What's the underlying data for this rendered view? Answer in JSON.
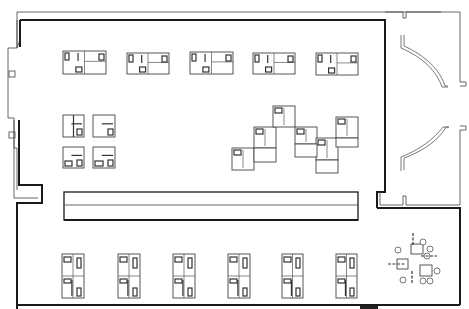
{
  "diagram": {
    "type": "architectural-floor-plan",
    "colors": {
      "background": "#ffffff",
      "line": "#2a2a2a",
      "line_light": "#555555"
    },
    "hall": {
      "outer_wall": "M17,12 L441,12 M17,12 L17,48 L8,48 L8,118 L14,118 L14,148 L17,148 L17,190",
      "inner_wall": "M20,20 L157,20 L157,20 L385,20 L385,195 L377,195",
      "corridor_left": "M17,190 L17,210 L42,210 L42,190 M20,190 L20,205 L42,205",
      "corridor_beam": {
        "x": 64,
        "y": 192,
        "w": 294,
        "h": 28
      },
      "corridor_divider_y": 205,
      "lower_wall": "M16,218 L16,309 M16,218 L42,218 L42,210",
      "right_lower_wall": "M377,195 L377,218 L460,218 L460,309",
      "bottom_line": "M16,307 L460,307"
    },
    "entry": {
      "outer_wall": "M385,12 L403,12 L403,18 L406,18 L406,12 L460,12 L460,82 L464,82 L464,85 L460,85",
      "outer_wall_lower": "M460,126 L464,126 L464,129 L460,129 L460,205 L403,205 L403,197 L406,197 L406,205",
      "doors": [
        {
          "name": "upper-curved-door",
          "path": "M404,35 L404,46 C426,56 440,70 445,86 L448,86"
        },
        {
          "name": "lower-curved-door",
          "path": "M404,170 L404,158 C426,150 440,138 446,127 L449,127"
        }
      ]
    },
    "top_row_units": [
      {
        "x": 63,
        "y": 51,
        "w": 43,
        "h": 23
      },
      {
        "x": 127,
        "y": 53,
        "w": 42,
        "h": 21
      },
      {
        "x": 190,
        "y": 52,
        "w": 43,
        "h": 22
      },
      {
        "x": 253,
        "y": 53,
        "w": 42,
        "h": 21
      },
      {
        "x": 316,
        "y": 53,
        "w": 42,
        "h": 22
      }
    ],
    "middle_left_units": [
      {
        "x": 63,
        "y": 115,
        "w": 21,
        "h": 22
      },
      {
        "x": 93,
        "y": 115,
        "w": 22,
        "h": 22
      },
      {
        "x": 63,
        "y": 147,
        "w": 21,
        "h": 21
      },
      {
        "x": 93,
        "y": 147,
        "w": 22,
        "h": 21
      }
    ],
    "stepped_cluster": [
      {
        "x": 232,
        "y": 148,
        "w": 22,
        "h": 22
      },
      {
        "x": 254,
        "y": 127,
        "w": 22,
        "h": 21
      },
      {
        "x": 273,
        "y": 106,
        "w": 22,
        "h": 21
      },
      {
        "x": 295,
        "y": 127,
        "w": 22,
        "h": 17
      },
      {
        "x": 316,
        "y": 138,
        "w": 22,
        "h": 22
      },
      {
        "x": 336,
        "y": 117,
        "w": 22,
        "h": 21
      }
    ],
    "bottom_row_units": [
      {
        "x": 62,
        "y": 254,
        "w": 22,
        "h": 44
      },
      {
        "x": 118,
        "y": 254,
        "w": 22,
        "h": 44
      },
      {
        "x": 173,
        "y": 254,
        "w": 22,
        "h": 44
      },
      {
        "x": 228,
        "y": 254,
        "w": 22,
        "h": 44
      },
      {
        "x": 282,
        "y": 254,
        "w": 21,
        "h": 44
      },
      {
        "x": 336,
        "y": 254,
        "w": 21,
        "h": 44
      }
    ],
    "furniture_group": {
      "tables": [
        {
          "x": 411,
          "y": 244,
          "w": 12,
          "h": 10
        },
        {
          "x": 397,
          "y": 259,
          "w": 11,
          "h": 10
        },
        {
          "x": 420,
          "y": 265,
          "w": 12,
          "h": 11
        }
      ],
      "chairs": [
        {
          "cx": 423,
          "cy": 242,
          "r": 3
        },
        {
          "cx": 430,
          "cy": 249,
          "r": 3
        },
        {
          "cx": 427,
          "cy": 256,
          "r": 3
        },
        {
          "cx": 398,
          "cy": 250,
          "r": 3
        },
        {
          "cx": 437,
          "cy": 271,
          "r": 3
        },
        {
          "cx": 403,
          "cy": 280,
          "r": 3
        },
        {
          "cx": 423,
          "cy": 281,
          "r": 3
        },
        {
          "cx": 430,
          "cy": 281,
          "r": 3
        }
      ],
      "dash_marks": [
        "M413,233 L413,246",
        "M388,264 L405,264",
        "M421,256 L437,256",
        "M412,271 L412,284"
      ]
    },
    "pillars": [
      {
        "x": 9,
        "y": 71,
        "w": 6,
        "h": 6
      },
      {
        "x": 9,
        "y": 132,
        "w": 6,
        "h": 6
      }
    ],
    "scale_bar": {
      "x": 360,
      "y": 306,
      "w": 18,
      "h": 3
    }
  }
}
